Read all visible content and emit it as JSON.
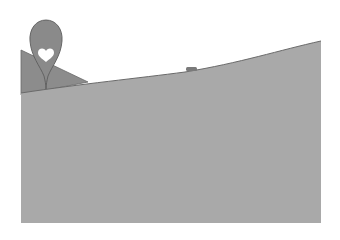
{
  "illustration": {
    "description": "Grayscale landscape illustration with a location pin containing a heart",
    "colors": {
      "background": "#ffffff",
      "ground": "#a9a9a9",
      "hill": "#8c8c8c",
      "pin": "#8a8a8a",
      "pin_outline": "#5e5e5e",
      "outline": "#6a6a6a",
      "heart": "#ffffff"
    },
    "icons": [
      "location-pin-icon",
      "heart-icon"
    ]
  }
}
